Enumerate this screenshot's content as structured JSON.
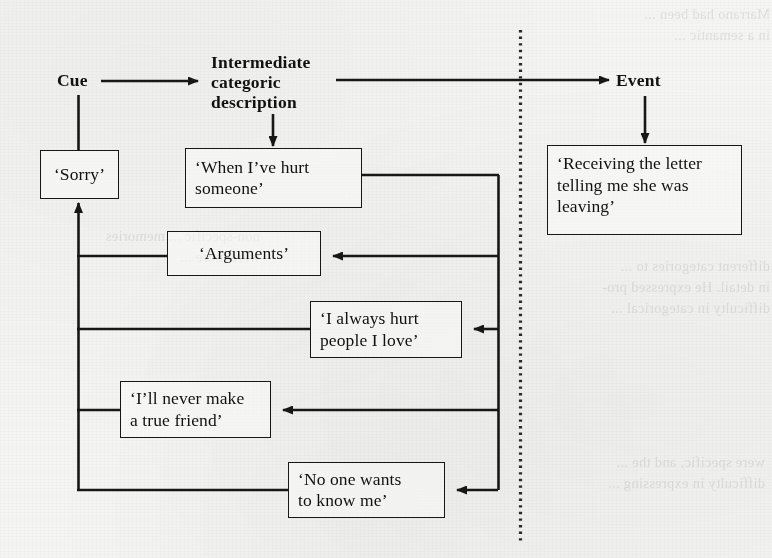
{
  "figure": {
    "type": "flow-diagram",
    "paper_color": "#f5f5f3",
    "ink_color": "#171717",
    "divider": {
      "name": "dotted-vertical-divider",
      "style": "dotted",
      "x": 520,
      "y_start": 30,
      "y_end": 542
    }
  },
  "labels": {
    "cue": "Cue",
    "intermediate": "Intermediate\ncategoric\ndescription",
    "event": "Event"
  },
  "nodes": [
    {
      "id": "sorry",
      "text": "‘Sorry’",
      "x": 40,
      "y": 150,
      "w": 79,
      "h": 49,
      "align": "center"
    },
    {
      "id": "when-hurt",
      "text": "‘When I’ve hurt\nsomeone’",
      "x": 185,
      "y": 148,
      "w": 177,
      "h": 60,
      "align": "left"
    },
    {
      "id": "arguments",
      "text": "‘Arguments’",
      "x": 167,
      "y": 231,
      "w": 154,
      "h": 45,
      "align": "center"
    },
    {
      "id": "always-hurt",
      "text": "‘I always hurt\npeople I love’",
      "x": 310,
      "y": 301,
      "w": 152,
      "h": 57,
      "align": "left"
    },
    {
      "id": "never-friend",
      "text": "‘I’ll never make\na true friend’",
      "x": 120,
      "y": 381,
      "w": 151,
      "h": 57,
      "align": "left"
    },
    {
      "id": "no-one",
      "text": "‘No one wants\nto know me’",
      "x": 288,
      "y": 462,
      "w": 157,
      "h": 56,
      "align": "left"
    },
    {
      "id": "receiving",
      "text": "‘Receiving the letter\ntelling me she was\nleaving’",
      "x": 547,
      "y": 145,
      "w": 195,
      "h": 90,
      "align": "left"
    }
  ],
  "connectors": [
    {
      "id": "cue-to-intermediate",
      "from": "cue",
      "to": "intermediate",
      "kind": "arrow-right"
    },
    {
      "id": "intermediate-to-event",
      "from": "intermediate",
      "to": "event",
      "kind": "arrow-right"
    },
    {
      "id": "cue-to-sorry",
      "from": "cue",
      "to": "sorry",
      "kind": "line-down"
    },
    {
      "id": "intermediate-to-when",
      "from": "intermediate",
      "to": "when-hurt",
      "kind": "arrow-down"
    },
    {
      "id": "event-to-receiving",
      "from": "event",
      "to": "receiving",
      "kind": "arrow-down"
    },
    {
      "id": "trunk-to-sorry",
      "from": "left-trunk",
      "to": "sorry",
      "kind": "arrow-up"
    },
    {
      "id": "when-to-trunk",
      "from": "when-hurt",
      "to": "right-trunk",
      "kind": "line"
    },
    {
      "id": "trunk-to-arguments",
      "from": "right-trunk",
      "to": "arguments",
      "kind": "arrow-left"
    },
    {
      "id": "arguments-to-trunk",
      "from": "arguments",
      "to": "left-trunk",
      "kind": "line"
    },
    {
      "id": "trunk-to-always",
      "from": "right-trunk",
      "to": "always-hurt",
      "kind": "arrow-left"
    },
    {
      "id": "always-to-trunk",
      "from": "always-hurt",
      "to": "left-trunk",
      "kind": "line"
    },
    {
      "id": "trunk-to-never",
      "from": "right-trunk",
      "to": "never-friend",
      "kind": "arrow-left"
    },
    {
      "id": "never-to-trunk",
      "from": "never-friend",
      "to": "left-trunk",
      "kind": "line"
    },
    {
      "id": "trunk-to-noone",
      "from": "right-trunk",
      "to": "no-one",
      "kind": "arrow-left"
    },
    {
      "id": "noone-to-trunk",
      "from": "no-one",
      "to": "left-trunk",
      "kind": "line"
    }
  ],
  "bleed_through": {
    "note": "faint mirrored text showing through the page from the reverse side",
    "lines_top_right": "Marrano had been ...\nin a semantic ...",
    "lines_left": "non-specific ... memories\nwere more ...",
    "lines_mid_right": "different categories to ...\nin detail. He expressed pro-\ndifficulty in categorical ...",
    "lines_bottom_right": "were specific, and the ...\ndifficulty in expressing ..."
  }
}
